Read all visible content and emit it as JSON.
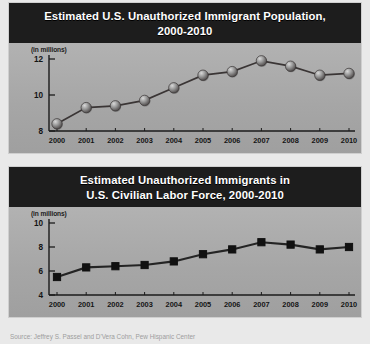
{
  "source_note": "Source: Jeffrey S. Passel and D'Vera Cohn, Pew Hispanic Center",
  "charts": [
    {
      "id": "unauthorized-immigrant-population",
      "title_line1": "Estimated U.S. Unauthorized Immigrant Population,",
      "title_line2": "2000-2010",
      "units_label": "(in millions)",
      "marker": "sphere",
      "chart_data": {
        "type": "line",
        "title": "Estimated U.S. Unauthorized Immigrant Population, 2000-2010",
        "xlabel": "",
        "ylabel": "(in millions)",
        "categories": [
          "2000",
          "2001",
          "2002",
          "2003",
          "2004",
          "2005",
          "2006",
          "2007",
          "2008",
          "2009",
          "2010"
        ],
        "values": [
          8.4,
          9.3,
          9.4,
          9.7,
          10.4,
          11.1,
          11.3,
          11.9,
          11.6,
          11.1,
          11.2
        ],
        "ylim": [
          8,
          12
        ],
        "yticks": [
          8,
          10,
          12
        ],
        "grid": false,
        "legend": "none"
      }
    },
    {
      "id": "unauthorized-immigrants-labor-force",
      "title_line1": "Estimated Unauthorized Immigrants in",
      "title_line2": "U.S. Civilian Labor Force, 2000-2010",
      "units_label": "(in millions)",
      "marker": "square",
      "chart_data": {
        "type": "line",
        "title": "Estimated Unauthorized Immigrants in U.S. Civilian Labor Force, 2000-2010",
        "xlabel": "",
        "ylabel": "(in millions)",
        "categories": [
          "2000",
          "2001",
          "2002",
          "2003",
          "2004",
          "2005",
          "2006",
          "2007",
          "2008",
          "2009",
          "2010"
        ],
        "values": [
          5.5,
          6.3,
          6.4,
          6.5,
          6.8,
          7.4,
          7.8,
          8.4,
          8.2,
          7.8,
          8.0
        ],
        "ylim": [
          4,
          10
        ],
        "yticks": [
          4,
          6,
          8,
          10
        ],
        "grid": false,
        "legend": "none"
      }
    }
  ],
  "colors": {
    "title_band": "#1d1d1d",
    "plot_background": "#a9a9a9",
    "poster_background": "#e9e9e9",
    "line": "#3a3535",
    "marker": "#111111",
    "axis": "#1b1b1b",
    "title_text": "#ffffff"
  }
}
